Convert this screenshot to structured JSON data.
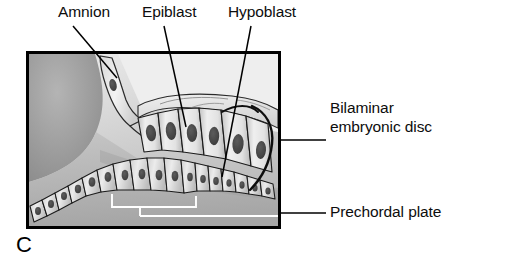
{
  "figure": {
    "panel_letter": "C",
    "type": "anatomical-illustration",
    "frame": {
      "x": 27,
      "y": 52,
      "width": 253,
      "height": 176,
      "border_color": "#000000"
    }
  },
  "labels": {
    "amnion": "Amnion",
    "epiblast": "Epiblast",
    "hypoblast": "Hypoblast",
    "bilaminar_disc": "Bilaminar embryonic disc",
    "prechordal_plate": "Prechordal plate"
  },
  "colors": {
    "ink": "#0d0d0d",
    "frame": "#000000",
    "background_light": "#e9e9e9",
    "background_mid": "#c8c8c8",
    "background_dark": "#9a9a9a",
    "cell_fill_light": "#ededed",
    "cell_fill_mid": "#cfcfcf",
    "nucleus": "#4a4a4a",
    "marker_white": "#ffffff",
    "outline": "#1a1a1a"
  },
  "structures": [
    {
      "name": "amnion",
      "description": "thin membrane sheet rising at upper left of disc, single flattened cell with dark nucleus"
    },
    {
      "name": "epiblast",
      "description": "upper layer of tall columnar cells with large dark oval nuclei"
    },
    {
      "name": "hypoblast",
      "description": "lower layer of smaller cuboidal cells curving down to the left"
    },
    {
      "name": "bilaminar-embryonic-disc",
      "description": "two-layered disc at right, bounded by dark curved outline"
    },
    {
      "name": "prechordal-plate",
      "description": "region marked by white bracket lines beneath the hypoblast"
    },
    {
      "name": "yolk-sac-cavity",
      "description": "large graded gray mass filling the left of the frame"
    }
  ],
  "leaders": {
    "amnion": "diagonal line from label down-right to amnion membrane",
    "epiblast": "near-vertical line from label down to epiblast cell",
    "hypoblast": "near-vertical line from label down to hypoblast cell",
    "bilaminar_disc": "horizontal rule from frame right edge to label",
    "prechordal_plate": "horizontal rule from frame right edge to label"
  }
}
